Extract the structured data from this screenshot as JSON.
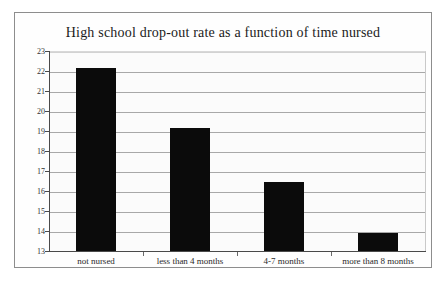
{
  "chart_data": {
    "type": "bar",
    "title": "High school drop-out rate as a function of time nursed",
    "xlabel": "",
    "ylabel": "Percentage dropouts",
    "categories": [
      "not nursed",
      "less than 4 months",
      "4-7 months",
      "more than 8 months"
    ],
    "values": [
      22.2,
      19.2,
      16.5,
      13.95
    ],
    "ylim": [
      13,
      23
    ],
    "yticks": [
      13,
      14,
      15,
      16,
      17,
      18,
      19,
      20,
      21,
      22,
      23
    ],
    "ytick_labels": [
      "13",
      "14",
      "15",
      "16",
      "17",
      "18",
      "19",
      "20",
      "21",
      "22",
      "23"
    ],
    "grid": true,
    "legend": false,
    "bar_color": "#0b0b0b",
    "background_color": "#fbfbfb",
    "gridline_color": "#a8a8a8",
    "axis_color": "#4a4a4a",
    "border_color": "#8d8d8d"
  }
}
